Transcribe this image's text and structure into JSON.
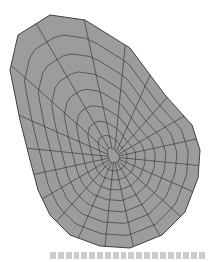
{
  "figure": {
    "type": "finite-element mesh",
    "colors": {
      "fill": "#9a9a9a",
      "lines": "#3a3a3a",
      "background": "#ffffff"
    },
    "center": [
      114,
      157
    ],
    "rings": 8,
    "spokes": 20
  },
  "caption": {
    "text": "",
    "legible": false
  }
}
